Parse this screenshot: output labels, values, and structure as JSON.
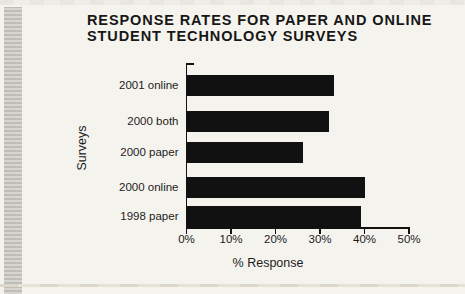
{
  "page": {
    "background_color": "#f5f3ee",
    "edge_strip_color": "#c8c7c3"
  },
  "chart_data": {
    "type": "bar",
    "orientation": "horizontal",
    "title": "RESPONSE RATES FOR PAPER AND ONLINE STUDENT TECHNOLOGY SURVEYS",
    "title_lines": [
      "RESPONSE RATES FOR PAPER AND ONLINE",
      "STUDENT TECHNOLOGY SURVEYS"
    ],
    "categories": [
      "2001 online",
      "2000 both",
      "2000 paper",
      "2000 online",
      "1998 paper"
    ],
    "values": [
      33,
      32,
      26,
      40,
      39
    ],
    "xlabel": "% Response",
    "ylabel": "Surveys",
    "xlim": [
      0,
      50
    ],
    "xticks": [
      "0%",
      "10%",
      "20%",
      "30%",
      "40%",
      "50%"
    ],
    "grid": false,
    "legend": "none",
    "bar_color": "#111111"
  }
}
